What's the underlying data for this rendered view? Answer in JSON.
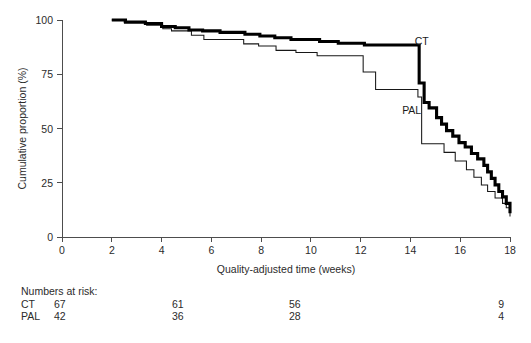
{
  "figure": {
    "background": "#ffffff",
    "plot": {
      "left_px": 62,
      "right_px": 510,
      "top_px": 20,
      "bottom_px": 237
    }
  },
  "chart_data": {
    "type": "line",
    "subtype": "kaplan-meier-step",
    "title": "",
    "xlabel": "Quality-adjusted time (weeks)",
    "ylabel": "Cumulative proportion (%)",
    "xlim": [
      0,
      18
    ],
    "ylim": [
      0,
      100
    ],
    "xticks": [
      0,
      2,
      4,
      6,
      8,
      10,
      12,
      14,
      16,
      18
    ],
    "xticklabels": [
      "0",
      "2",
      "4",
      "6",
      "8",
      "10",
      "12",
      "14",
      "16",
      "18"
    ],
    "yticks": [
      0,
      25,
      50,
      75,
      100
    ],
    "yticklabels": [
      "0",
      "25",
      "50",
      "75",
      "100"
    ],
    "grid": false,
    "legend_position": "inline-annotation",
    "series": [
      {
        "name": "CT",
        "label": "CT",
        "color": "#000000",
        "linewidth": 3.1,
        "label_x": 14.45,
        "label_y": 88.5,
        "points": [
          [
            2.0,
            100.0
          ],
          [
            2.55,
            100.0
          ],
          [
            2.55,
            99.0
          ],
          [
            3.35,
            99.0
          ],
          [
            3.35,
            98.4
          ],
          [
            4.0,
            98.4
          ],
          [
            4.0,
            97.0
          ],
          [
            4.55,
            97.0
          ],
          [
            4.55,
            96.4
          ],
          [
            5.1,
            96.4
          ],
          [
            5.1,
            95.4
          ],
          [
            5.65,
            95.4
          ],
          [
            5.65,
            95.0
          ],
          [
            6.35,
            95.0
          ],
          [
            6.35,
            94.3
          ],
          [
            7.35,
            94.3
          ],
          [
            7.35,
            93.4
          ],
          [
            7.95,
            93.4
          ],
          [
            7.95,
            92.6
          ],
          [
            8.55,
            92.6
          ],
          [
            8.55,
            91.8
          ],
          [
            9.2,
            91.8
          ],
          [
            9.2,
            91.0
          ],
          [
            10.35,
            91.0
          ],
          [
            10.35,
            90.1
          ],
          [
            11.1,
            90.1
          ],
          [
            11.1,
            89.3
          ],
          [
            12.15,
            89.3
          ],
          [
            12.15,
            88.5
          ],
          [
            14.35,
            88.5
          ],
          [
            14.35,
            71.0
          ],
          [
            14.55,
            71.0
          ],
          [
            14.55,
            62.0
          ],
          [
            14.75,
            62.0
          ],
          [
            14.75,
            59.5
          ],
          [
            15.05,
            59.5
          ],
          [
            15.05,
            55.0
          ],
          [
            15.25,
            55.0
          ],
          [
            15.25,
            52.0
          ],
          [
            15.45,
            52.0
          ],
          [
            15.45,
            49.0
          ],
          [
            15.7,
            49.0
          ],
          [
            15.7,
            46.5
          ],
          [
            15.95,
            46.5
          ],
          [
            15.95,
            43.5
          ],
          [
            16.2,
            43.5
          ],
          [
            16.2,
            41.5
          ],
          [
            16.45,
            41.5
          ],
          [
            16.45,
            38.5
          ],
          [
            16.7,
            38.5
          ],
          [
            16.7,
            36.0
          ],
          [
            16.95,
            36.0
          ],
          [
            16.95,
            33.0
          ],
          [
            17.1,
            33.0
          ],
          [
            17.1,
            30.0
          ],
          [
            17.25,
            30.0
          ],
          [
            17.25,
            27.0
          ],
          [
            17.4,
            27.0
          ],
          [
            17.4,
            24.0
          ],
          [
            17.55,
            24.0
          ],
          [
            17.55,
            21.0
          ],
          [
            17.7,
            21.0
          ],
          [
            17.7,
            18.5
          ],
          [
            17.85,
            18.5
          ],
          [
            17.85,
            15.5
          ],
          [
            18.0,
            15.5
          ],
          [
            18.0,
            11.0
          ]
        ]
      },
      {
        "name": "PAL",
        "label": "PAL",
        "color": "#171717",
        "linewidth": 1.05,
        "label_x": 14.05,
        "label_y": 56.5,
        "points": [
          [
            2.0,
            100.0
          ],
          [
            2.5,
            100.0
          ],
          [
            2.5,
            99.0
          ],
          [
            3.4,
            99.0
          ],
          [
            3.4,
            97.6
          ],
          [
            4.05,
            97.6
          ],
          [
            4.05,
            96.0
          ],
          [
            4.4,
            96.0
          ],
          [
            4.4,
            95.0
          ],
          [
            5.2,
            95.0
          ],
          [
            5.2,
            93.0
          ],
          [
            5.7,
            93.0
          ],
          [
            5.7,
            91.0
          ],
          [
            7.3,
            91.0
          ],
          [
            7.3,
            89.0
          ],
          [
            7.9,
            89.0
          ],
          [
            7.9,
            88.0
          ],
          [
            8.6,
            88.0
          ],
          [
            8.6,
            86.0
          ],
          [
            9.4,
            86.0
          ],
          [
            9.4,
            85.0
          ],
          [
            10.25,
            85.0
          ],
          [
            10.25,
            83.5
          ],
          [
            12.1,
            83.5
          ],
          [
            12.1,
            76.0
          ],
          [
            12.6,
            76.0
          ],
          [
            12.6,
            68.0
          ],
          [
            14.3,
            68.0
          ],
          [
            14.3,
            64.5
          ],
          [
            14.45,
            64.5
          ],
          [
            14.45,
            43.0
          ],
          [
            15.35,
            43.0
          ],
          [
            15.35,
            39.0
          ],
          [
            15.8,
            39.0
          ],
          [
            15.8,
            35.0
          ],
          [
            16.25,
            35.0
          ],
          [
            16.25,
            31.0
          ],
          [
            16.55,
            31.0
          ],
          [
            16.55,
            27.5
          ],
          [
            16.85,
            27.5
          ],
          [
            16.85,
            24.0
          ],
          [
            17.1,
            24.0
          ],
          [
            17.1,
            21.0
          ],
          [
            17.4,
            21.0
          ],
          [
            17.4,
            18.0
          ],
          [
            17.7,
            18.0
          ],
          [
            17.7,
            15.5
          ],
          [
            17.85,
            15.5
          ],
          [
            17.85,
            13.5
          ],
          [
            18.0,
            13.5
          ],
          [
            18.0,
            9.5
          ]
        ]
      }
    ]
  },
  "risk_table": {
    "title": "Numbers at risk:",
    "rows": [
      {
        "group": "CT",
        "values": [
          "67",
          "61",
          "56",
          "9"
        ]
      },
      {
        "group": "PAL",
        "values": [
          "42",
          "36",
          "28",
          "4"
        ]
      }
    ],
    "value_x_px": [
      78,
      196,
      313,
      505
    ]
  }
}
